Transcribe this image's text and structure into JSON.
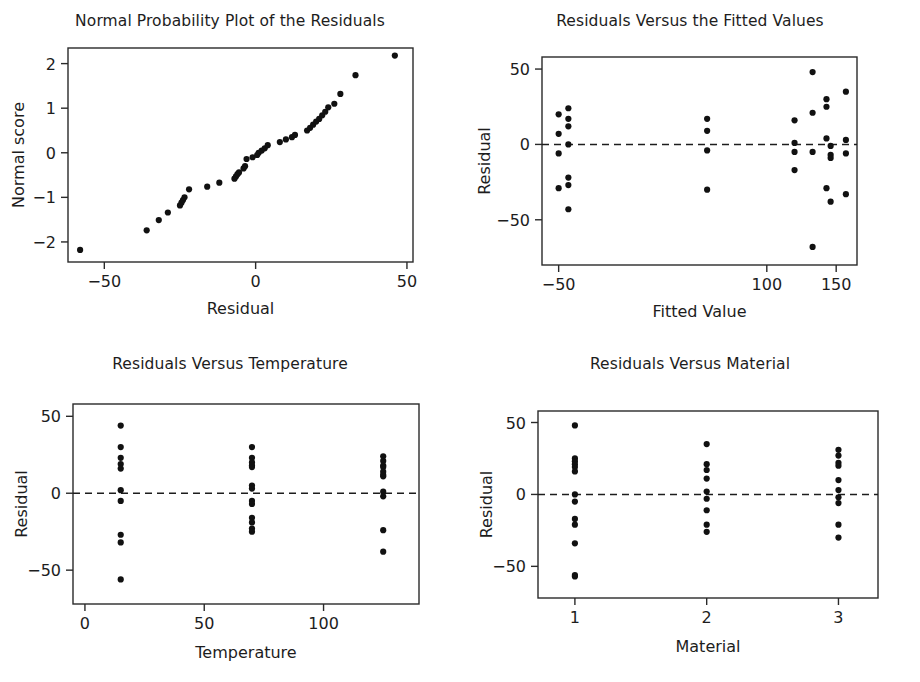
{
  "figure": {
    "background": "#ffffff",
    "point_color": "#111111",
    "axis_color": "#2a2a2a"
  },
  "chart_data": [
    {
      "type": "scatter",
      "panel": "top-left",
      "title": "Normal Probability Plot of the Residuals",
      "xlabel": "Residual",
      "ylabel": "Normal score",
      "xlim": [
        -62,
        52
      ],
      "ylim": [
        -2.45,
        2.35
      ],
      "xticks": [
        -50,
        0,
        50
      ],
      "yticks": [
        -2,
        -1,
        0,
        1,
        2
      ],
      "xtick_labels": [
        "−50",
        "0",
        "50"
      ],
      "ytick_labels": [
        "−2",
        "−1",
        "0",
        "1",
        "2"
      ],
      "grid": false,
      "legend": "none",
      "x": [
        -58,
        -36,
        -32,
        -29,
        -25,
        -24.5,
        -24,
        -23.5,
        -22,
        -16,
        -12,
        -7,
        -6.5,
        -6,
        -5.5,
        -4,
        -3.5,
        -3,
        -1,
        0.5,
        1,
        2,
        3,
        4,
        8,
        10,
        12,
        13,
        17,
        18,
        19,
        20,
        21,
        22,
        23,
        24,
        26,
        28,
        33,
        46
      ],
      "y": [
        -2.18,
        -1.74,
        -1.51,
        -1.34,
        -1.18,
        -1.12,
        -1.06,
        -1.0,
        -0.82,
        -0.76,
        -0.67,
        -0.58,
        -0.53,
        -0.48,
        -0.44,
        -0.35,
        -0.3,
        -0.14,
        -0.1,
        -0.05,
        0.0,
        0.05,
        0.1,
        0.17,
        0.24,
        0.3,
        0.35,
        0.4,
        0.5,
        0.56,
        0.63,
        0.7,
        0.76,
        0.84,
        0.92,
        1.02,
        1.1,
        1.32,
        1.74,
        2.18
      ]
    },
    {
      "type": "scatter",
      "panel": "top-right",
      "title": "Residuals Versus the Fitted Values",
      "xlabel": "Fitted Value",
      "ylabel": "Residual",
      "xlim": [
        -62,
        165
      ],
      "ylim": [
        -80,
        58
      ],
      "xticks": [
        -50,
        100,
        150
      ],
      "yticks": [
        -50,
        0,
        50
      ],
      "xtick_labels": [
        "−50",
        "100",
        "150"
      ],
      "ytick_labels": [
        "−50",
        "0",
        "50"
      ],
      "grid": false,
      "reference_line": 0,
      "legend": "none",
      "x": [
        -50,
        -50,
        -50,
        -50,
        -43,
        -43,
        -43,
        -43,
        -43,
        -43,
        -43,
        57,
        57,
        57,
        57,
        120,
        120,
        120,
        120,
        133,
        133,
        133,
        133,
        143,
        143,
        143,
        143,
        146,
        146,
        146,
        146,
        157,
        157,
        157,
        157
      ],
      "y": [
        20,
        7,
        -6,
        -29,
        24,
        17,
        12,
        0,
        -22,
        -27,
        -43,
        17,
        9,
        -4,
        -30,
        16,
        1,
        -5,
        -17,
        48,
        21,
        -5,
        -68,
        25,
        30,
        4,
        -29,
        -7,
        -9,
        -38,
        -1,
        35,
        3,
        -6,
        -33
      ]
    },
    {
      "type": "scatter",
      "panel": "bottom-left",
      "title": "Residuals Versus Temperature",
      "xlabel": "Temperature",
      "ylabel": "Residual",
      "xlim": [
        -5,
        140
      ],
      "ylim": [
        -72,
        58
      ],
      "xticks": [
        0,
        50,
        100
      ],
      "yticks": [
        -50,
        0,
        50
      ],
      "xtick_labels": [
        "0",
        "50",
        "100"
      ],
      "ytick_labels": [
        "−50",
        "0",
        "50"
      ],
      "grid": false,
      "reference_line": 0,
      "legend": "none",
      "groups": [
        {
          "x": 15,
          "values": [
            44,
            30,
            23,
            19,
            16,
            2,
            -5,
            -27,
            -32,
            -56
          ]
        },
        {
          "x": 70,
          "values": [
            30,
            23,
            20,
            18,
            17,
            5,
            3,
            -5,
            -7,
            -16,
            -19,
            -23,
            -25
          ]
        },
        {
          "x": 125,
          "values": [
            24,
            21,
            18,
            17,
            14,
            12,
            11,
            1,
            -2,
            -24,
            -38
          ]
        }
      ]
    },
    {
      "type": "scatter",
      "panel": "bottom-right",
      "title": "Residuals Versus Material",
      "xlabel": "Material",
      "ylabel": "Residual",
      "xlim": [
        0.72,
        3.3
      ],
      "ylim": [
        -72,
        58
      ],
      "xticks": [
        1,
        2,
        3
      ],
      "yticks": [
        -50,
        0,
        50
      ],
      "xtick_labels": [
        "1",
        "2",
        "3"
      ],
      "ytick_labels": [
        "−50",
        "0",
        "50"
      ],
      "grid": false,
      "reference_line": 0,
      "legend": "none",
      "groups": [
        {
          "x": 1,
          "values": [
            48,
            25,
            23,
            21,
            19,
            16,
            0,
            -5,
            -17,
            -21,
            -34,
            -56,
            -57
          ]
        },
        {
          "x": 2,
          "values": [
            35,
            21,
            17,
            11,
            2,
            -3,
            -11,
            -21,
            -26
          ]
        },
        {
          "x": 3,
          "values": [
            31,
            27,
            22,
            20,
            10,
            3,
            -2,
            -6,
            -21,
            -30
          ]
        }
      ]
    }
  ]
}
